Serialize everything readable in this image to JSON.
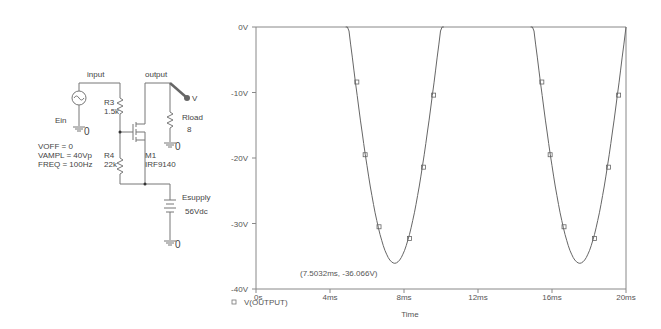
{
  "schematic": {
    "net_labels": {
      "input": "input",
      "output": "output"
    },
    "source": {
      "name": "Ein",
      "params": [
        "VOFF = 0",
        "VAMPL = 40Vp",
        "FREQ = 100Hz"
      ]
    },
    "r3": {
      "name": "R3",
      "value": "1.5k"
    },
    "r4": {
      "name": "R4",
      "value": "22k"
    },
    "m1": {
      "name": "M1",
      "value": "IRF9140"
    },
    "rload": {
      "name": "Rload",
      "value": "8"
    },
    "supply": {
      "name": "Esupply",
      "value": "56Vdc"
    },
    "ground_label": "0",
    "probe_label": "V",
    "colors": {
      "wire": "#777777",
      "probe": "#666666"
    }
  },
  "chart_data": {
    "type": "line",
    "title": "",
    "xlabel": "Time",
    "ylabel": "",
    "xlim": [
      0,
      20
    ],
    "ylim": [
      -40,
      0
    ],
    "x_unit": "ms",
    "x_ticks": [
      "0s",
      "4ms",
      "8ms",
      "12ms",
      "16ms",
      "20ms"
    ],
    "y_ticks": [
      "0V",
      "-10V",
      "-20V",
      "-30V",
      "-40V"
    ],
    "grid": false,
    "legend": {
      "position": "bottom-left",
      "entries": [
        {
          "marker": "square",
          "label": "V(OUTPUT)"
        }
      ]
    },
    "annotation": "(7.5032ms, -36.066V)",
    "series": [
      {
        "name": "V(OUTPUT)",
        "description": "Negative half-sine lobes clipped above 0V; zero crossings ~5ms, ~10ms, ~15ms, ~20ms; minimum -36.066V at 7.5032ms and ~17.5ms",
        "x": [
          5.0,
          5.4,
          5.9,
          6.5,
          7.0,
          7.5,
          8.0,
          8.7,
          9.2,
          9.8,
          10.0,
          15.0,
          15.4,
          15.9,
          16.5,
          17.0,
          17.5,
          18.0,
          18.7,
          19.2,
          19.8,
          20.0
        ],
        "values": [
          0,
          -8.5,
          -19.6,
          -30.6,
          -34.3,
          -36.07,
          -34.3,
          -32.4,
          -21.5,
          -10.5,
          0,
          0,
          -8.5,
          -19.6,
          -30.6,
          -34.3,
          -36.07,
          -34.3,
          -32.4,
          -21.5,
          -10.5,
          0
        ]
      }
    ],
    "markers": [
      {
        "x": 5.45,
        "y": -8.4
      },
      {
        "x": 5.9,
        "y": -19.5
      },
      {
        "x": 6.65,
        "y": -30.5
      },
      {
        "x": 8.3,
        "y": -32.3
      },
      {
        "x": 9.05,
        "y": -21.4
      },
      {
        "x": 9.6,
        "y": -10.4
      },
      {
        "x": 15.45,
        "y": -8.4
      },
      {
        "x": 15.9,
        "y": -19.5
      },
      {
        "x": 16.65,
        "y": -30.5
      },
      {
        "x": 18.3,
        "y": -32.3
      },
      {
        "x": 19.05,
        "y": -21.4
      },
      {
        "x": 19.6,
        "y": -10.4
      }
    ],
    "colors": {
      "trace": "#666666",
      "axis": "#888888",
      "text": "#555555"
    }
  }
}
